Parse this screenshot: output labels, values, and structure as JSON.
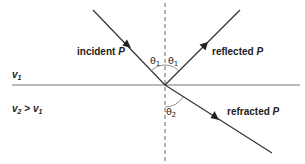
{
  "diagram": {
    "title": "",
    "labels": {
      "incident": "incident",
      "incident_var": "P",
      "reflected": "reflected",
      "reflected_var": "P",
      "refracted": "refracted",
      "refracted_var": "P",
      "medium1_v": "v",
      "medium1_sub": "1",
      "medium2_v": "v",
      "medium2_sub": "2",
      "medium2_rel": ">",
      "medium2_v1": "v",
      "medium2_v1_sub": "1",
      "theta_symbol": "θ",
      "theta1_sub": "1",
      "theta2_sub": "2"
    },
    "geometry": {
      "interface_y": 85,
      "incidence_point": [
        165,
        85
      ],
      "incident_start": [
        93,
        10
      ],
      "reflected_end": [
        240,
        10
      ],
      "refracted_end": [
        272,
        153
      ],
      "normal_top": 3,
      "normal_bottom": 162
    },
    "colors": {
      "line": "#333333",
      "interface": "#777777",
      "normal": "#555555",
      "text": "#222222"
    }
  }
}
